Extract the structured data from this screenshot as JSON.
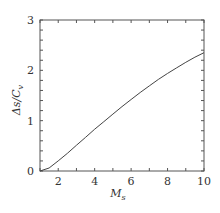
{
  "chart_data": {
    "type": "line",
    "title": "",
    "xlabel": "M_s",
    "ylabel": "Δs/C_v",
    "xlim": [
      1,
      10
    ],
    "ylim": [
      0,
      3
    ],
    "grid": false,
    "legend": null,
    "x_ticks": [
      2,
      4,
      6,
      8,
      10
    ],
    "y_ticks": [
      0,
      1,
      2,
      3
    ],
    "x_minor_step": 1,
    "y_minor_step": 0.2,
    "series": [
      {
        "name": "Δs/C_v",
        "x": [
          1,
          1.5,
          2,
          2.5,
          3,
          3.5,
          4,
          4.5,
          5,
          5.5,
          6,
          6.5,
          7,
          7.5,
          8,
          8.5,
          9,
          9.5,
          10
        ],
        "values": [
          0,
          0.06,
          0.2,
          0.35,
          0.51,
          0.67,
          0.83,
          0.98,
          1.13,
          1.28,
          1.42,
          1.56,
          1.69,
          1.82,
          1.94,
          2.05,
          2.16,
          2.26,
          2.35
        ]
      }
    ]
  },
  "labels": {
    "x_ticks": [
      "2",
      "4",
      "6",
      "8",
      "10"
    ],
    "y_ticks": [
      "0",
      "1",
      "2",
      "3"
    ],
    "xlabel_main": "M",
    "xlabel_sub": "s",
    "ylabel_main": "Δs/C",
    "ylabel_sub": "v"
  },
  "colors": {
    "axis": "#555555",
    "line": "#444444",
    "text": "#333333"
  }
}
